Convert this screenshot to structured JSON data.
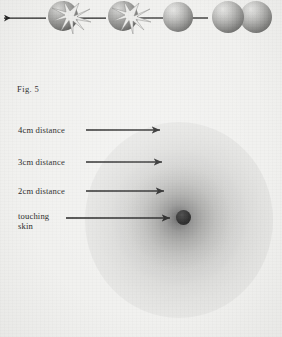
{
  "figure": {
    "caption": "Fig. 5",
    "background_color": "#f1f1ef",
    "ink_color": "#262626"
  },
  "top_sequence": {
    "description": "sequence of spheres with starburst energy, joined by leftward arrows",
    "items": [
      {
        "name": "sphere-with-starburst-left",
        "type": "sphere-starburst",
        "cx": 63,
        "cy": 16,
        "r": 15
      },
      {
        "name": "sphere-with-starburst-mid",
        "type": "sphere-starburst",
        "cx": 123,
        "cy": 16,
        "r": 15
      },
      {
        "name": "sphere-plain",
        "type": "sphere",
        "cx": 177,
        "cy": 17,
        "r": 15
      },
      {
        "name": "sphere-pair-left",
        "type": "sphere",
        "cx": 227,
        "cy": 17,
        "r": 16
      },
      {
        "name": "sphere-pair-right",
        "type": "sphere",
        "cx": 255,
        "cy": 17,
        "r": 16
      }
    ],
    "arrows": [
      {
        "name": "arrow-1",
        "x1": 46,
        "x2": 2,
        "y": 18,
        "direction": "left"
      },
      {
        "name": "arrow-2",
        "x1": 106,
        "x2": 70,
        "y": 18,
        "direction": "left"
      },
      {
        "name": "arrow-3",
        "x1": 163,
        "x2": 130,
        "y": 18,
        "direction": "left"
      },
      {
        "name": "arrow-4",
        "x1": 208,
        "x2": 184,
        "y": 18,
        "direction": "left"
      }
    ]
  },
  "field_diagram": {
    "center_label": "energy field emanating from source point",
    "source_point": {
      "name": "skin-contact-point",
      "cx": 183,
      "cy": 217,
      "r": 7.5,
      "color": "#141414"
    },
    "sphere": {
      "cx": 179,
      "cy": 220,
      "rx": 94,
      "ry": 98,
      "inner_color": "#4d4d4d",
      "outer_color": "#f1f1ef"
    },
    "measurements": [
      {
        "id": "4cm",
        "label": "4cm distance",
        "label_lines": [
          "4cm distance"
        ],
        "arrow_y": 130,
        "arrow_x_start": 86,
        "arrow_x_end": 164
      },
      {
        "id": "3cm",
        "label": "3cm distance",
        "label_lines": [
          "3cm distance"
        ],
        "arrow_y": 162,
        "arrow_x_start": 86,
        "arrow_x_end": 166
      },
      {
        "id": "2cm",
        "label": "2cm distance",
        "label_lines": [
          "2cm distance"
        ],
        "arrow_y": 191,
        "arrow_x_start": 86,
        "arrow_x_end": 168
      },
      {
        "id": "touching",
        "label": "touching skin",
        "label_lines": [
          "touching",
          "skin"
        ],
        "arrow_y": 218,
        "arrow_x_start": 66,
        "arrow_x_end": 174
      }
    ]
  }
}
